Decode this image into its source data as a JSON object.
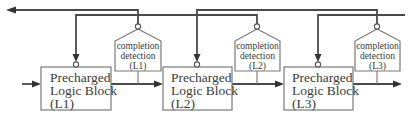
{
  "diagram": {
    "type": "pipeline-block-diagram",
    "stages": [
      {
        "id": "L1",
        "block": {
          "line1": "Precharged",
          "line2": "Logic Block",
          "line3": "(L1)"
        },
        "completion": {
          "line1": "completion",
          "line2": "detection",
          "line3": "(L1)"
        }
      },
      {
        "id": "L2",
        "block": {
          "line1": "Precharged",
          "line2": "Logic Block",
          "line3": "(L2)"
        },
        "completion": {
          "line1": "completion",
          "line2": "detection",
          "line3": "(L2)"
        }
      },
      {
        "id": "L3",
        "block": {
          "line1": "Precharged",
          "line2": "Logic Block",
          "line3": "(L3)"
        },
        "completion": {
          "line1": "completion",
          "line2": "detection",
          "line3": "(L3)"
        }
      }
    ],
    "connections": [
      {
        "from": "input",
        "to": "L1 block"
      },
      {
        "from": "L1 block",
        "to": "L2 block"
      },
      {
        "from": "L2 block",
        "to": "L3 block"
      },
      {
        "from": "L3 block",
        "to": "output"
      },
      {
        "from": "L1 block output",
        "to": "completion detection (L1)"
      },
      {
        "from": "L2 block output",
        "to": "completion detection (L2)"
      },
      {
        "from": "L3 block output",
        "to": "completion detection (L3)"
      },
      {
        "from": "completion detection (L1)",
        "to": "previous stage (left output)"
      },
      {
        "from": "completion detection (L2)",
        "to": "L1 block precharge"
      },
      {
        "from": "completion detection (L3)",
        "to": "L2 block precharge"
      },
      {
        "from": "next stage (right input)",
        "to": "L3 block precharge"
      }
    ],
    "colors": {
      "line": "#4a4a4a",
      "box_border": "#7a7a7a",
      "text": "#3a3a3a",
      "background": "#ffffff"
    }
  }
}
